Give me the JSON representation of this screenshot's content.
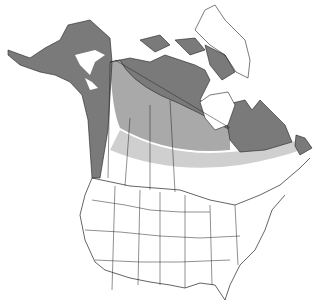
{
  "map": {
    "type": "species range map",
    "region": "North America",
    "colors": {
      "background": "#ffffff",
      "outline": "#222222",
      "range_dark": "#7a7a7a",
      "range_medium": "#a9a9a9",
      "range_light": "#cfcfcf",
      "water_patch": "#ffffff"
    },
    "layers": [
      {
        "name": "year-round range",
        "shade": "dark",
        "areas": [
          "Alaska",
          "Yukon",
          "Northwest Territories",
          "Nunavut mainland",
          "Arctic islands (south)",
          "Northern Quebec",
          "Labrador",
          "Newfoundland",
          "Rocky Mountain corridor",
          "Baffin Island coast"
        ]
      },
      {
        "name": "transition band",
        "shade": "medium",
        "areas": [
          "Northern Alberta",
          "Northern Saskatchewan",
          "Northern Manitoba",
          "Northern Ontario"
        ]
      },
      {
        "name": "southern fringe",
        "shade": "light",
        "areas": [
          "Central Canada prairies",
          "Southern Quebec"
        ]
      }
    ]
  }
}
